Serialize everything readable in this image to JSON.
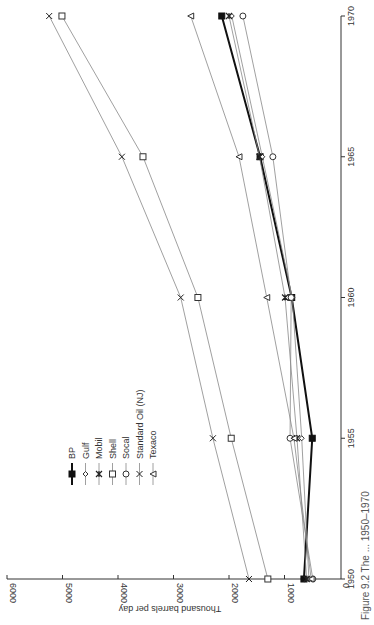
{
  "chart_data": {
    "type": "line",
    "orientation": "rotated-90-ccw",
    "title": "",
    "caption": "Figure 9.2  The ... 1950–1970",
    "xlabel": "",
    "ylabel": "Thousand barrels per day",
    "x": [
      1950,
      1955,
      1960,
      1965,
      1970
    ],
    "x_ticks": [
      "1950",
      "1955",
      "1960",
      "1965",
      "1970"
    ],
    "y_ticks": [
      "0",
      "1000",
      "2000",
      "3000",
      "4000",
      "5000",
      "6000"
    ],
    "ylim": [
      0,
      6000
    ],
    "grid": false,
    "legend_position": "upper-left (in rotated frame)",
    "series": [
      {
        "name": "BP",
        "marker": "filled-square",
        "bold": true,
        "values": [
          650,
          500,
          870,
          1440,
          2130
        ]
      },
      {
        "name": "Gulf",
        "marker": "diamond",
        "bold": false,
        "values": [
          560,
          690,
          860,
          1400,
          1950
        ]
      },
      {
        "name": "Mobil",
        "marker": "asterisk",
        "bold": false,
        "values": [
          600,
          775,
          990,
          1450,
          2000
        ]
      },
      {
        "name": "Shell",
        "marker": "open-square",
        "bold": false,
        "values": [
          1300,
          1960,
          2560,
          3550,
          5010
        ]
      },
      {
        "name": "Socal",
        "marker": "open-circle",
        "bold": false,
        "values": [
          490,
          900,
          880,
          1210,
          1750
        ]
      },
      {
        "name": "Standard Oil (NJ)",
        "marker": "x",
        "bold": false,
        "values": [
          1640,
          2290,
          2870,
          3930,
          5240
        ]
      },
      {
        "name": "Texaco",
        "marker": "triangle",
        "bold": false,
        "values": [
          520,
          830,
          1320,
          1820,
          2690
        ]
      }
    ]
  },
  "legend": {
    "items": [
      "BP",
      "Gulf",
      "Mobil",
      "Shell",
      "Socal",
      "Standard Oil (NJ)",
      "Texaco"
    ]
  },
  "axes": {
    "value_axis_label": "Thousand barrels per day",
    "year_ticks": [
      "1950",
      "1955",
      "1960",
      "1965",
      "1970"
    ],
    "value_ticks": [
      "0",
      "1000",
      "2000",
      "3000",
      "4000",
      "5000",
      "6000"
    ]
  },
  "caption_text": "Figure 9.2  The ... 1950–1970"
}
